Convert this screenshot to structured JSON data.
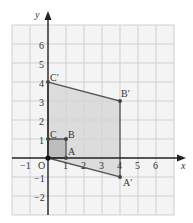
{
  "axes": {
    "x_label": "x",
    "y_label": "y",
    "origin_label": "O",
    "x_ticks": [
      {
        "v": -1,
        "label": "−1"
      },
      {
        "v": 1,
        "label": "1"
      },
      {
        "v": 2,
        "label": "2"
      },
      {
        "v": 3,
        "label": "3"
      },
      {
        "v": 4,
        "label": "4"
      },
      {
        "v": 5,
        "label": "5"
      },
      {
        "v": 6,
        "label": "6"
      }
    ],
    "y_ticks": [
      {
        "v": 6,
        "label": "6"
      },
      {
        "v": 5,
        "label": "5"
      },
      {
        "v": 4,
        "label": "4"
      },
      {
        "v": 3,
        "label": "3"
      },
      {
        "v": 2,
        "label": "2"
      },
      {
        "v": 1,
        "label": "1"
      },
      {
        "v": -1,
        "label": "−1"
      },
      {
        "v": -2,
        "label": "−2"
      }
    ],
    "x_range": [
      -2,
      7
    ],
    "y_range": [
      -3,
      7
    ]
  },
  "shapes": {
    "original": {
      "name": "OABC",
      "points": [
        {
          "label": "O",
          "x": 0,
          "y": 0
        },
        {
          "label": "A",
          "x": 1,
          "y": 0
        },
        {
          "label": "B",
          "x": 1,
          "y": 1
        },
        {
          "label": "C",
          "x": 0,
          "y": 1
        }
      ]
    },
    "image": {
      "name": "OA'B'C'",
      "points": [
        {
          "label": "O",
          "x": 0,
          "y": 0
        },
        {
          "label": "A′",
          "x": 4,
          "y": -1
        },
        {
          "label": "B′",
          "x": 4,
          "y": 3
        },
        {
          "label": "C′",
          "x": 0,
          "y": 4
        }
      ]
    }
  },
  "labels": {
    "A": "A",
    "B": "B",
    "C": "C",
    "A_prime": "A′",
    "B_prime": "B′",
    "C_prime": "C′"
  },
  "colors": {
    "grid": "#cfcfcf",
    "grid_bg": "#f4f4f4",
    "axis": "#222222",
    "shape_fill": "#d6d6d6",
    "shape_stroke": "#555555",
    "small_square_fill": "#bdbdbd",
    "point": "#444444"
  }
}
